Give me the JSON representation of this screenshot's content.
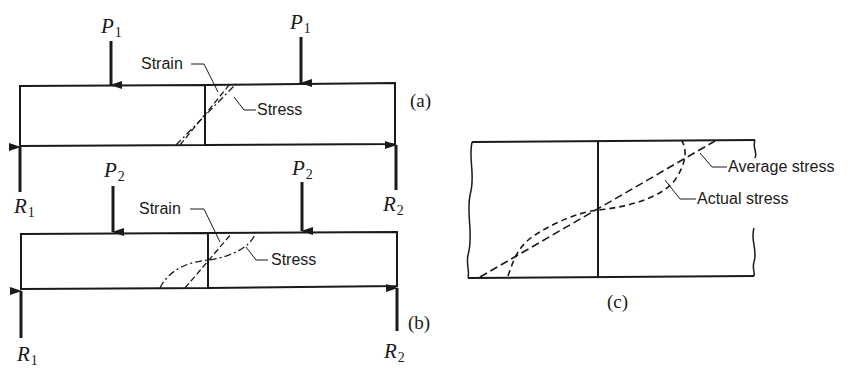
{
  "figure": {
    "panels": [
      {
        "id": "a",
        "caption": "(a)",
        "loads": [
          {
            "symbol": "P",
            "subscript": "1"
          },
          {
            "symbol": "P",
            "subscript": "1"
          }
        ],
        "reactions": [
          {
            "symbol": "R",
            "subscript": "1"
          },
          {
            "symbol": "R",
            "subscript": "2"
          }
        ],
        "annotations": {
          "strain": "Strain",
          "stress": "Stress"
        }
      },
      {
        "id": "b",
        "caption": "(b)",
        "loads": [
          {
            "symbol": "P",
            "subscript": "2"
          },
          {
            "symbol": "P",
            "subscript": "2"
          }
        ],
        "reactions": [
          {
            "symbol": "R",
            "subscript": "1"
          },
          {
            "symbol": "R",
            "subscript": "2"
          }
        ],
        "annotations": {
          "strain": "Strain",
          "stress": "Stress"
        }
      },
      {
        "id": "c",
        "caption": "(c)",
        "annotations": {
          "average_stress": "Average stress",
          "actual_stress": "Actual stress"
        }
      }
    ],
    "colors": {
      "ink": "#1a1a1a",
      "background": "#ffffff"
    }
  }
}
